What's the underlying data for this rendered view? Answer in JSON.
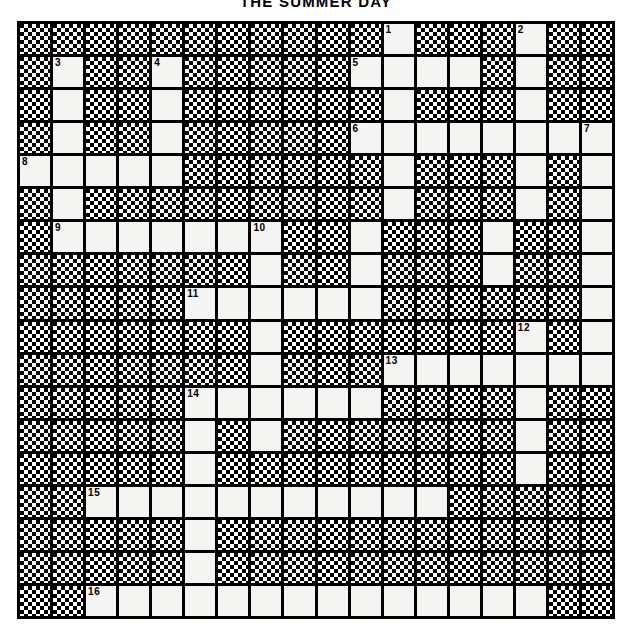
{
  "title": "THE SUMMER DAY",
  "grid": {
    "rows": 18,
    "cols": 18,
    "block_color": "#000000",
    "open_color": "#f4f4f2",
    "numbers": {
      "r1c12": "1",
      "r1c16": "2",
      "r2c2": "3",
      "r2c5": "4",
      "r2c11": "5",
      "r4c11": "6",
      "r4c18": "7",
      "r5c1": "8",
      "r7c2": "9",
      "r7c8": "10",
      "r9c6": "11",
      "r10c16": "12",
      "r11c12": "13",
      "r12c6": "14",
      "r15c3": "15",
      "r18c3": "16"
    },
    "open_cells": [
      "r1c12",
      "r1c16",
      "r2c2",
      "r2c5",
      "r2c11",
      "r2c12",
      "r2c13",
      "r2c14",
      "r2c16",
      "r3c2",
      "r3c5",
      "r3c12",
      "r3c16",
      "r4c2",
      "r4c5",
      "r4c11",
      "r4c12",
      "r4c13",
      "r4c14",
      "r4c15",
      "r4c16",
      "r4c17",
      "r4c18",
      "r5c1",
      "r5c2",
      "r5c3",
      "r5c4",
      "r5c5",
      "r5c12",
      "r5c16",
      "r5c18",
      "r6c2",
      "r6c12",
      "r6c16",
      "r6c18",
      "r7c2",
      "r7c3",
      "r7c4",
      "r7c5",
      "r7c6",
      "r7c7",
      "r7c8",
      "r7c11",
      "r7c15",
      "r7c18",
      "r8c8",
      "r8c11",
      "r8c15",
      "r8c18",
      "r9c6",
      "r9c7",
      "r9c8",
      "r9c9",
      "r9c10",
      "r9c11",
      "r9c18",
      "r10c8",
      "r10c16",
      "r10c18",
      "r11c8",
      "r11c12",
      "r11c13",
      "r11c14",
      "r11c15",
      "r11c16",
      "r11c17",
      "r11c18",
      "r12c6",
      "r12c7",
      "r12c8",
      "r12c9",
      "r12c10",
      "r12c11",
      "r12c16",
      "r13c6",
      "r13c8",
      "r13c16",
      "r14c6",
      "r14c16",
      "r15c3",
      "r15c4",
      "r15c5",
      "r15c6",
      "r15c7",
      "r15c8",
      "r15c9",
      "r15c10",
      "r15c11",
      "r15c12",
      "r15c13",
      "r16c6",
      "r17c6",
      "r18c3",
      "r18c4",
      "r18c5",
      "r18c6",
      "r18c7",
      "r18c8",
      "r18c9",
      "r18c10",
      "r18c11",
      "r18c12",
      "r18c13",
      "r18c14",
      "r18c15",
      "r18c16"
    ]
  }
}
